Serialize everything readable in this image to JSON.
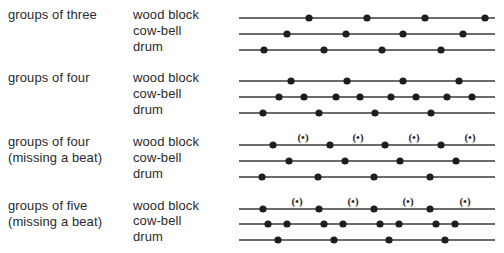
{
  "groups": [
    {
      "label_lines": [
        "groups of three"
      ],
      "instruments": [
        {
          "name": "wood block",
          "y": 18,
          "beats": [
            309,
            367,
            425,
            485
          ],
          "rests": []
        },
        {
          "name": "cow-bell",
          "y": 34,
          "beats": [
            287,
            346,
            403,
            463
          ],
          "rests": []
        },
        {
          "name": "drum",
          "y": 50,
          "beats": [
            264,
            324,
            382,
            441
          ],
          "rests": []
        }
      ]
    },
    {
      "label_lines": [
        "groups of four"
      ],
      "instruments": [
        {
          "name": "wood block",
          "y": 81,
          "beats": [
            291,
            347,
            403,
            459
          ],
          "rests": []
        },
        {
          "name": "cow-bell",
          "y": 97,
          "beats": [
            279,
            304,
            336,
            360,
            391,
            416,
            447,
            472
          ],
          "rests": []
        },
        {
          "name": "drum",
          "y": 113,
          "beats": [
            263,
            319,
            375,
            431
          ],
          "rests": []
        }
      ]
    },
    {
      "label_lines": [
        "groups of four",
        "(missing a beat)"
      ],
      "instruments": [
        {
          "name": "wood block",
          "y": 145,
          "beats": [
            273,
            330,
            385,
            441
          ],
          "rests": [
            303,
            358,
            414,
            470
          ]
        },
        {
          "name": "cow-bell",
          "y": 161,
          "beats": [
            289,
            345,
            400,
            456
          ],
          "rests": []
        },
        {
          "name": "drum",
          "y": 177,
          "beats": [
            262,
            318,
            374,
            430
          ],
          "rests": []
        }
      ]
    },
    {
      "label_lines": [
        "groups of five",
        "(missing a beat)"
      ],
      "instruments": [
        {
          "name": "wood block",
          "y": 209,
          "beats": [
            263,
            319,
            374,
            430
          ],
          "rests": [
            297,
            353,
            408,
            465
          ]
        },
        {
          "name": "cow-bell",
          "y": 224,
          "beats": [
            268,
            287,
            324,
            343,
            380,
            399,
            436,
            455
          ],
          "rests": []
        },
        {
          "name": "drum",
          "y": 240,
          "beats": [
            278,
            334,
            389,
            445
          ],
          "rests": []
        }
      ]
    }
  ],
  "rest_symbol": "(•)",
  "line": {
    "x_start": 239,
    "x_end": 495,
    "color": "#3a3a3a"
  },
  "dot": {
    "radius": 3.6,
    "color": "#1e1e1e"
  },
  "layout": {
    "group_label_x": 8,
    "instrument_label_x": 133
  }
}
